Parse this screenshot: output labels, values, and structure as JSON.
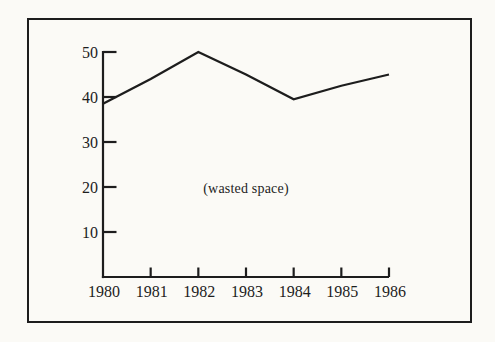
{
  "figure": {
    "paper_color": "#fbfaf6",
    "ink_color": "#1d1d1d"
  },
  "chart_data": {
    "type": "line",
    "title": "",
    "x": [
      1980,
      1981,
      1982,
      1983,
      1984,
      1985,
      1986
    ],
    "xtick_labels": [
      "1980",
      "1981",
      "1982",
      "1983",
      "1984",
      "1985",
      "1986"
    ],
    "series": [
      {
        "name": "series-1",
        "values": [
          38.5,
          44,
          50,
          45,
          39.5,
          42.5,
          45
        ]
      }
    ],
    "xlabel": "",
    "ylabel": "",
    "ylim": [
      0,
      50
    ],
    "yticks": [
      10,
      20,
      30,
      40,
      50
    ],
    "ytick_labels": [
      "10",
      "20",
      "30",
      "40",
      "50"
    ],
    "grid": false,
    "legend_position": "none",
    "annotation": {
      "text": "(wasted space)",
      "x": 1983,
      "y": 19.5
    }
  }
}
